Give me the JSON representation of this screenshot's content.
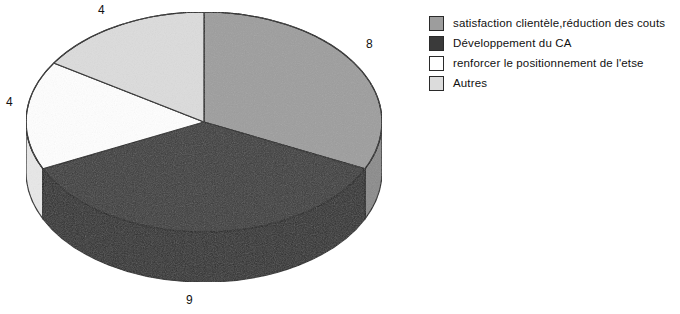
{
  "chart_data": {
    "type": "pie",
    "title": "",
    "subtitle": "",
    "xlabel": "",
    "ylabel": "",
    "three_d": true,
    "total": 25,
    "start_angle_deg": 0,
    "direction": "clockwise",
    "legend_position": "right",
    "grid": false,
    "categories": [
      "satisfaction clientèle,réduction des couts",
      "Développement du CA",
      "renforcer le positionnement de l'etse",
      "Autres"
    ],
    "values": [
      8,
      9,
      4,
      4
    ],
    "data_labels": [
      "8",
      "9",
      "4",
      "4"
    ],
    "colors": [
      "#9d9d9d",
      "#3a3a3a",
      "#ffffff",
      "#dcdcdc"
    ],
    "side_colors": [
      "#8a8a8a",
      "#2e2e2e",
      "#e8e8e8",
      "#c9c9c9"
    ],
    "slice_angles_deg": [
      115.2,
      129.6,
      57.6,
      57.6
    ],
    "outline_color": "#1f1f1f"
  },
  "labels": {
    "top": "4",
    "right": "8",
    "left": "4",
    "bottom": "9"
  },
  "legend": {
    "items": [
      {
        "label": "satisfaction clientèle,réduction des couts",
        "color": "#9d9d9d"
      },
      {
        "label": "Développement du CA",
        "color": "#3a3a3a"
      },
      {
        "label": "renforcer le positionnement de l'etse",
        "color": "#ffffff"
      },
      {
        "label": "Autres",
        "color": "#dcdcdc"
      }
    ]
  }
}
